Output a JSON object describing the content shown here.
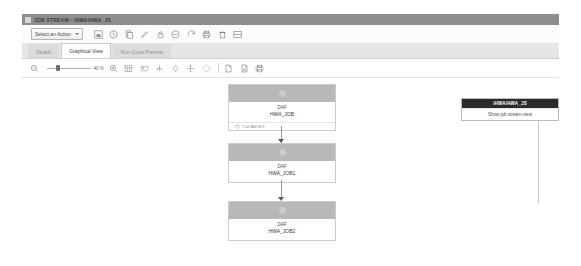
{
  "window": {
    "title": "JOB STREAM - /HWA/HWA_JS",
    "icon": "window-icon"
  },
  "action_toolbar": {
    "select_label": "Select an Action",
    "caret_icon": "chevron-down-icon",
    "buttons": [
      {
        "name": "save-icon",
        "title": "Save"
      },
      {
        "name": "clock-icon",
        "title": "Time"
      },
      {
        "name": "copy-icon",
        "title": "Copy"
      },
      {
        "name": "edit-pencil-icon",
        "title": "Edit"
      },
      {
        "name": "lock-icon",
        "title": "Lock"
      },
      {
        "name": "minus-circle-icon",
        "title": "Remove"
      },
      {
        "name": "refresh-icon",
        "title": "Refresh"
      },
      {
        "name": "printer-icon",
        "title": "Print"
      },
      {
        "name": "delete-trash-icon",
        "title": "Delete"
      },
      {
        "name": "window-layout-icon",
        "title": "Layout"
      }
    ]
  },
  "tabs": [
    {
      "label": "Details",
      "active": false
    },
    {
      "label": "Graphical View",
      "active": true
    },
    {
      "label": "Run Cycle Preview",
      "active": false
    }
  ],
  "view_toolbar": {
    "zoom_out_icon": "zoom-out-icon",
    "zoom_in_icon": "zoom-in-icon",
    "zoom_value": "40 %",
    "buttons": [
      {
        "name": "grid-view-icon",
        "title": "Grid"
      },
      {
        "name": "fit-window-icon",
        "title": "Fit to window"
      },
      {
        "name": "hierarchy-icon",
        "title": "Hierarchy"
      },
      {
        "name": "diamond-node-icon",
        "title": "Add node"
      },
      {
        "name": "move-arrows-icon",
        "title": "Move"
      },
      {
        "name": "reload-layout-icon",
        "title": "Reload layout"
      },
      {
        "name": "document-icon",
        "title": "Document"
      },
      {
        "name": "document-export-icon",
        "title": "Export"
      },
      {
        "name": "printer-icon",
        "title": "Print"
      }
    ]
  },
  "graph": {
    "nodes": [
      {
        "icon": "gear-icon",
        "type": "DAF",
        "name": "HWA_JOB",
        "meta_icon": "clock-icon",
        "meta": "7:00 AM  M-F"
      },
      {
        "icon": "gear-icon",
        "type": "DAF",
        "name": "HWA_JOB1",
        "meta_icon": "",
        "meta": ""
      },
      {
        "icon": "gear-icon",
        "type": "DAF",
        "name": "HWA_JOB2",
        "meta_icon": "",
        "meta": ""
      }
    ]
  },
  "side_panel": {
    "title": "/HWA/HWA_JS",
    "items": [
      {
        "label": "Show job stream view"
      }
    ]
  }
}
